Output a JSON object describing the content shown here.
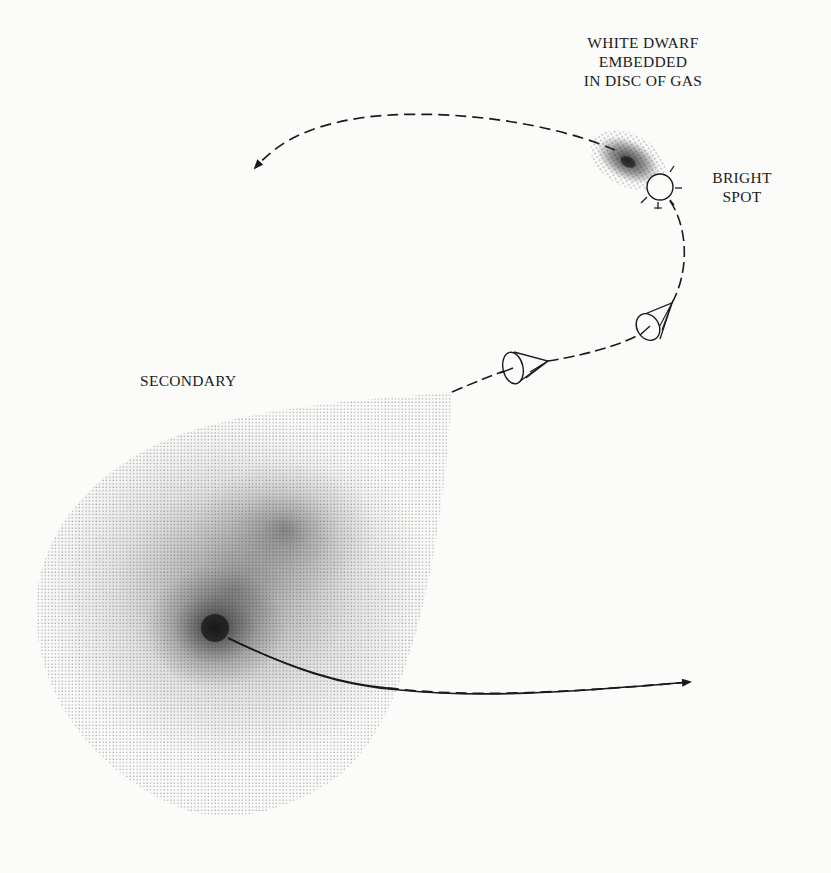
{
  "figure": {
    "type": "schematic diagram"
  },
  "labels": {
    "white_dwarf": [
      "WHITE DWARF",
      "EMBEDDED",
      "IN DISC OF GAS"
    ],
    "bright_spot": [
      "BRIGHT",
      "SPOT"
    ],
    "secondary": "SECONDARY"
  },
  "elements": {
    "secondary_star": "teardrop-shaped stippled gas envelope with dense core",
    "accretion_disc": "stippled elliptical disc around white dwarf",
    "bright_spot": "small circle with radiating ticks where stream hits disc",
    "gas_stream": "dashed path from secondary's tip to bright spot",
    "observer_cones": 2,
    "orbit_arrows": [
      "upper-left arrow from white dwarf",
      "lower-right arrow from secondary"
    ]
  },
  "colors": {
    "background": "#fbfbfa",
    "ink": "#1a1a1a",
    "stipple": "#8a8a8a"
  }
}
